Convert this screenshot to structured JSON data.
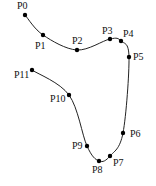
{
  "diagram": {
    "type": "spline-control-points",
    "curve_color": "#222222",
    "point_color": "#000000",
    "points": [
      {
        "label": "P0",
        "x": 25,
        "y": 15,
        "lx": 17,
        "ly": 9
      },
      {
        "label": "P1",
        "x": 43,
        "y": 35,
        "lx": 35,
        "ly": 49
      },
      {
        "label": "P2",
        "x": 77,
        "y": 50,
        "lx": 72,
        "ly": 44
      },
      {
        "label": "P3",
        "x": 110,
        "y": 39,
        "lx": 102,
        "ly": 34
      },
      {
        "label": "P4",
        "x": 121,
        "y": 41,
        "lx": 123,
        "ly": 37
      },
      {
        "label": "P5",
        "x": 129,
        "y": 57,
        "lx": 133,
        "ly": 60
      },
      {
        "label": "P6",
        "x": 123,
        "y": 133,
        "lx": 130,
        "ly": 137
      },
      {
        "label": "P7",
        "x": 110,
        "y": 156,
        "lx": 113,
        "ly": 166
      },
      {
        "label": "P8",
        "x": 99,
        "y": 161,
        "lx": 92,
        "ly": 173
      },
      {
        "label": "P9",
        "x": 87,
        "y": 146,
        "lx": 72,
        "ly": 149
      },
      {
        "label": "P10",
        "x": 69,
        "y": 95,
        "lx": 50,
        "ly": 102
      },
      {
        "label": "P11",
        "x": 32,
        "y": 70,
        "lx": 14,
        "ly": 78
      }
    ]
  }
}
